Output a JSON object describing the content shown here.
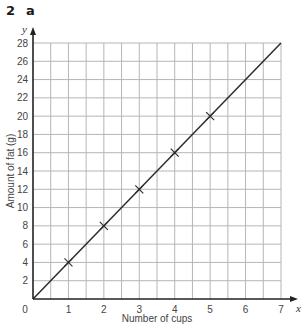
{
  "question": {
    "number": "2",
    "part": "a"
  },
  "chart_data": {
    "type": "line",
    "title": "",
    "xlabel": "Number of cups",
    "ylabel": "Amount of fat (g)",
    "x_axis_symbol": "x",
    "y_axis_symbol": "y",
    "xlim": [
      0,
      7
    ],
    "ylim": [
      0,
      28
    ],
    "x_ticks": [
      1,
      2,
      3,
      4,
      5,
      6,
      7
    ],
    "y_ticks": [
      2,
      4,
      6,
      8,
      10,
      12,
      14,
      16,
      18,
      20,
      22,
      24,
      26,
      28
    ],
    "origin_label": "0",
    "grid": true,
    "x_grid_step": 0.5,
    "y_grid_step": 2,
    "series": [
      {
        "name": "Amount of fat",
        "line": {
          "x": [
            0,
            7
          ],
          "y": [
            0,
            28
          ]
        },
        "markers": {
          "x": [
            1,
            2,
            3,
            4,
            5
          ],
          "y": [
            4,
            8,
            12,
            16,
            20
          ],
          "style": "cross"
        }
      }
    ],
    "colors": {
      "line": "#2b2b2b",
      "grid": "#b5b5b5",
      "axis": "#222222"
    }
  }
}
